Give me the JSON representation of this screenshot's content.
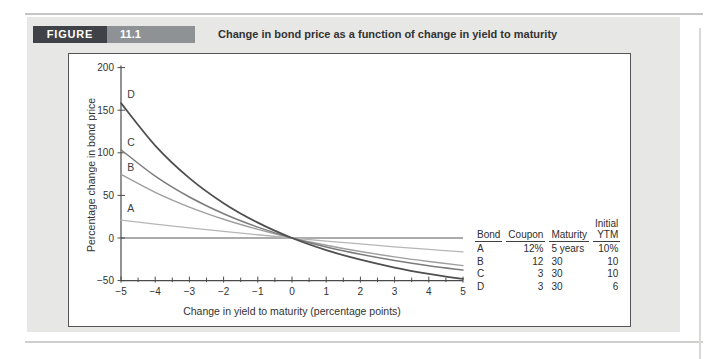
{
  "figure": {
    "label": "FIGURE",
    "number": "11.1",
    "title": "Change in bond price as a function of change in yield to maturity"
  },
  "chart_data": {
    "type": "line",
    "title": "",
    "xlabel": "Change in yield to maturity (percentage points)",
    "ylabel": "Percentage change in bond price",
    "xlim": [
      -5,
      5
    ],
    "ylim": [
      -50,
      200
    ],
    "grid": false,
    "legend_position": "none",
    "x_ticks": [
      -5,
      -4,
      -3,
      -2,
      -1,
      0,
      1,
      2,
      3,
      4,
      5
    ],
    "x_tick_labels": [
      "−5",
      "−4",
      "−3",
      "−2",
      "−1",
      "0",
      "1",
      "2",
      "3",
      "4",
      "5"
    ],
    "y_ticks": [
      200,
      150,
      100,
      50,
      0,
      -50
    ],
    "y_tick_labels": [
      "200",
      "150",
      "100",
      "50",
      "0",
      "−50"
    ],
    "x": [
      -5,
      -4,
      -3,
      -2,
      -1,
      0,
      1,
      2,
      3,
      4,
      5
    ],
    "series": [
      {
        "name": "A",
        "color": "#b6b6b6",
        "stroke_width": 1.3,
        "values": [
          21.1,
          16.4,
          12.0,
          7.8,
          3.8,
          0,
          -3.6,
          -7.0,
          -10.3,
          -13.4,
          -16.4
        ],
        "label_positions": [
          [
            -4.82,
            30
          ]
        ]
      },
      {
        "name": "B",
        "color": "#9f9f9f",
        "stroke_width": 1.4,
        "values": [
          74.7,
          53.6,
          36.3,
          22.0,
          10.1,
          0,
          -8.5,
          -15.9,
          -22.2,
          -27.6,
          -32.4
        ],
        "label_positions": [
          [
            -4.82,
            79
          ]
        ]
      },
      {
        "name": "C",
        "color": "#7c7c7c",
        "stroke_width": 1.5,
        "values": [
          103.6,
          72.6,
          48.1,
          28.5,
          12.8,
          0,
          -10.5,
          -19.1,
          -26.4,
          -32.5,
          -37.6
        ],
        "label_positions": [
          [
            -4.82,
            108
          ]
        ]
      },
      {
        "name": "D",
        "color": "#4f4f4f",
        "stroke_width": 1.8,
        "values": [
          158.3,
          108.5,
          70.3,
          40.9,
          18.0,
          0,
          -14.2,
          -25.5,
          -34.7,
          -42.1,
          -48.1
        ],
        "label_positions": [
          [
            -4.82,
            164
          ]
        ]
      }
    ]
  },
  "table": {
    "headers": [
      {
        "top": "",
        "label": "Bond"
      },
      {
        "top": "",
        "label": "Coupon"
      },
      {
        "top": "",
        "label": "Maturity"
      },
      {
        "top": "Initial",
        "label": "YTM"
      }
    ],
    "align": [
      "left",
      "right",
      "left",
      "right"
    ],
    "rows": [
      [
        "A",
        "12%",
        "5 years",
        "10%"
      ],
      [
        "B",
        "12",
        "30",
        "10"
      ],
      [
        "C",
        "3",
        "30",
        "10"
      ],
      [
        "D",
        "3",
        "30",
        "6"
      ]
    ]
  },
  "colors": {
    "panel_bg": "#e7e7e5",
    "figure_label_bg": "#3f4347",
    "figure_number_bg": "#8e9295",
    "axis": "#4a4a4a",
    "text": "#333333"
  }
}
